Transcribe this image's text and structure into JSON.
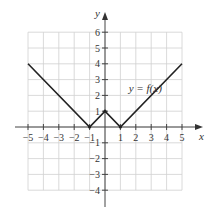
{
  "chart_data": {
    "type": "line",
    "title": "",
    "xlabel": "x",
    "ylabel": "y",
    "xlim": [
      -5,
      5
    ],
    "ylim": [
      -4,
      6
    ],
    "grid": true,
    "x_ticks": [
      -5,
      -4,
      -3,
      -2,
      -1,
      1,
      2,
      3,
      4,
      5
    ],
    "x_tick_labels": [
      "−5",
      "−4",
      "−3",
      "−2",
      "−1",
      "1",
      "2",
      "3",
      "4",
      "5"
    ],
    "y_ticks": [
      -4,
      -3,
      -2,
      -1,
      1,
      2,
      3,
      4,
      5,
      6
    ],
    "y_tick_labels": [
      "−4",
      "−3",
      "−2",
      "−1",
      "1",
      "2",
      "3",
      "4",
      "5",
      "6"
    ],
    "series": [
      {
        "name": "y = f(x)",
        "x": [
          -5,
          -1,
          0,
          1,
          5
        ],
        "y": [
          4,
          0,
          1,
          0,
          4
        ]
      }
    ],
    "annotations": [
      {
        "text": "y = f(x)",
        "x": 1.8,
        "y": 2.5
      }
    ]
  },
  "labels": {
    "x_axis": "x",
    "y_axis": "y",
    "curve": "y = f(x)"
  }
}
